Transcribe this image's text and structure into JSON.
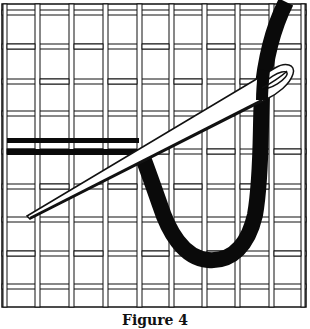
{
  "figure": {
    "caption": "Figure 4",
    "colors": {
      "background": "#ffffff",
      "ink": "#111111",
      "thread": "#0a0a0a"
    },
    "grid": {
      "columns": 9,
      "rows": 9
    },
    "elements": [
      "canvas-grid-icon",
      "needle-icon",
      "thread-icon"
    ]
  }
}
